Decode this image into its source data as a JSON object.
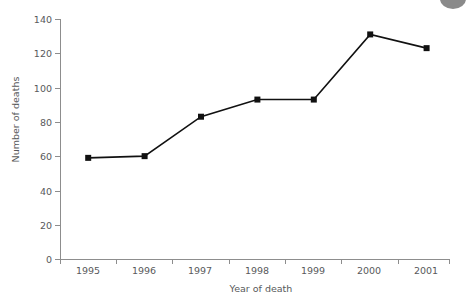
{
  "chart_data": {
    "type": "line",
    "title": "",
    "xlabel": "Year of death",
    "ylabel": "Number of deaths",
    "categories": [
      "1995",
      "1996",
      "1997",
      "1998",
      "1999",
      "2000",
      "2001"
    ],
    "x": [
      1995,
      1996,
      1997,
      1998,
      1999,
      2000,
      2001
    ],
    "values": [
      59,
      60,
      83,
      93,
      93,
      131,
      123
    ],
    "series": [
      {
        "name": "Number of deaths",
        "values": [
          59,
          60,
          83,
          93,
          93,
          131,
          123
        ]
      }
    ],
    "ylim": [
      0,
      140
    ],
    "ytick_labels": [
      "0",
      "20",
      "40",
      "60",
      "80",
      "100",
      "120",
      "140"
    ],
    "yticks": [
      0,
      20,
      40,
      60,
      80,
      100,
      120,
      140
    ],
    "xtick_labels": [
      "1995",
      "1996",
      "1997",
      "1998",
      "1999",
      "2000",
      "2001"
    ],
    "grid": false,
    "legend": "none",
    "marker": "square",
    "line_color": "#111111",
    "marker_color": "#111111",
    "axis_color": "#8d8d8d",
    "text_color": "#58595b",
    "background": "#ffffff"
  },
  "decoration": {
    "corner_blob_color": "#8a8a8a",
    "corner_blob_name": "gray-circle"
  }
}
